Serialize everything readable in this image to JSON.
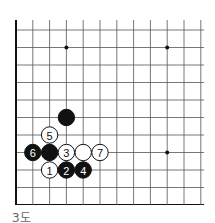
{
  "diagram": {
    "caption": "3도",
    "board": {
      "columns": 12,
      "rows": 11,
      "edges": [
        "left",
        "bottom"
      ],
      "grid_color": "#555555",
      "edge_color": "#111111"
    },
    "star_points": [
      {
        "col": 3,
        "row": 1
      },
      {
        "col": 9,
        "row": 1
      },
      {
        "col": 9,
        "row": 7
      }
    ],
    "stones": [
      {
        "color": "black",
        "col": 3,
        "row": 5,
        "label": ""
      },
      {
        "color": "white",
        "col": 2,
        "row": 6,
        "label": "5"
      },
      {
        "color": "black",
        "col": 1,
        "row": 7,
        "label": "6"
      },
      {
        "color": "black",
        "col": 2,
        "row": 7,
        "label": ""
      },
      {
        "color": "white",
        "col": 3,
        "row": 7,
        "label": "3"
      },
      {
        "color": "white",
        "col": 4,
        "row": 7,
        "label": ""
      },
      {
        "color": "white",
        "col": 5,
        "row": 7,
        "label": "7"
      },
      {
        "color": "white",
        "col": 2,
        "row": 8,
        "label": "1"
      },
      {
        "color": "black",
        "col": 3,
        "row": 8,
        "label": "2"
      },
      {
        "color": "black",
        "col": 4,
        "row": 8,
        "label": "4"
      }
    ]
  }
}
